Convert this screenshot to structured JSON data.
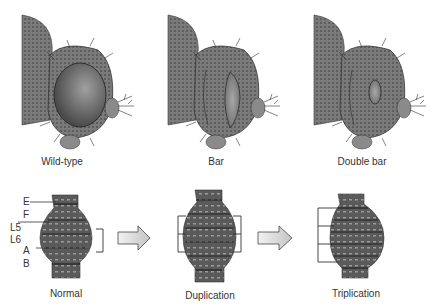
{
  "top_row": {
    "panels": [
      {
        "id": "wild-type",
        "label": "Wild-type",
        "eye": "round",
        "cx": 72
      },
      {
        "id": "bar",
        "label": "Bar",
        "eye": "narrow-bar",
        "cx": 216
      },
      {
        "id": "double-bar",
        "label": "Double bar",
        "eye": "small-oval",
        "cx": 362
      }
    ]
  },
  "bottom_row": {
    "chromosomes": [
      {
        "id": "normal",
        "label": "Normal",
        "region_copies": 1
      },
      {
        "id": "duplication",
        "label": "Duplication",
        "region_copies": 2
      },
      {
        "id": "triplication",
        "label": "Triplication",
        "region_copies": 3
      }
    ],
    "band_labels": [
      "E",
      "F",
      "L5",
      "L6",
      "A",
      "B"
    ],
    "arrows": [
      "normal-to-duplication",
      "duplication-to-triplication"
    ]
  },
  "colors": {
    "fly_body": "#6e6e6e",
    "fly_dark": "#3c3c3c",
    "eye": "#5a5a5a",
    "eye_highlight": "#9a9a9a",
    "chromosome": "#4a4a4a",
    "arrow_fill": "#d8d8d8",
    "line": "#333333"
  }
}
